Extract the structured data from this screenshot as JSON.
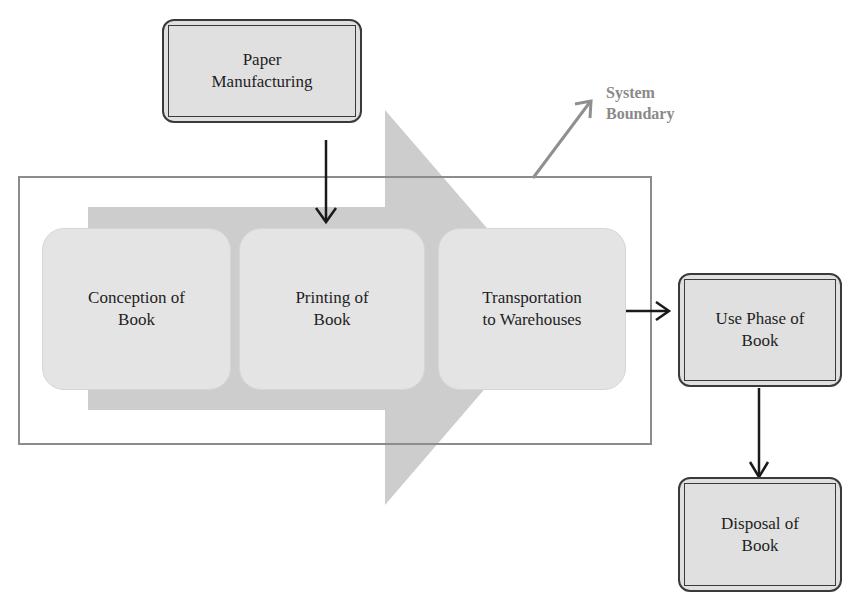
{
  "diagram": {
    "system_boundary_label": [
      "System",
      "Boundary"
    ],
    "nodes": {
      "paper_manufacturing": [
        "Paper",
        "Manufacturing"
      ],
      "conception": [
        "Conception of",
        "Book"
      ],
      "printing": [
        "Printing of",
        "Book"
      ],
      "transportation": [
        "Transportation",
        "to Warehouses"
      ],
      "use_phase": [
        "Use Phase of",
        "Book"
      ],
      "disposal": [
        "Disposal of",
        "Book"
      ]
    },
    "colors": {
      "big_arrow": "#cdcdcd",
      "stage_fill": "#e4e4e4",
      "boundary": "#8c8c8c",
      "arrows": "#1a1a1a",
      "boundary_label": "#8a8a8a"
    }
  }
}
